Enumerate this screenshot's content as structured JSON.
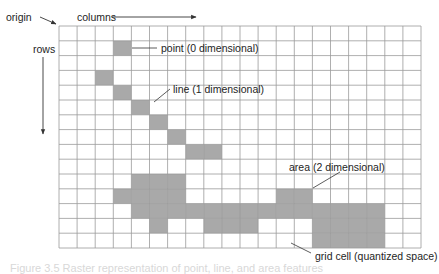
{
  "labels": {
    "origin": "origin",
    "columns": "columns",
    "rows": "rows",
    "point": "point (0 dimensional)",
    "line": "line (1 dimensional)",
    "area": "area (2 dimensional)",
    "grid_cell": "grid cell (quantized space)",
    "caption": "Figure 3.5  Raster representation of point, line, and area features"
  },
  "grid": {
    "columns": 20,
    "rows": 15,
    "left": 59,
    "top": 26,
    "cell_width": 18.1,
    "cell_height": 14.8,
    "line_color": "#9a9a9a",
    "fill_color": "#a9a9a9"
  },
  "features": {
    "point": [
      [
        1,
        3
      ]
    ],
    "line": [
      [
        3,
        2
      ],
      [
        4,
        3
      ],
      [
        5,
        4
      ],
      [
        6,
        5
      ],
      [
        7,
        6
      ],
      [
        8,
        7
      ],
      [
        8,
        8
      ]
    ],
    "area": [
      [
        10,
        4
      ],
      [
        10,
        5
      ],
      [
        10,
        6
      ],
      [
        11,
        3
      ],
      [
        11,
        4
      ],
      [
        11,
        5
      ],
      [
        11,
        6
      ],
      [
        11,
        12
      ],
      [
        11,
        13
      ],
      [
        12,
        4
      ],
      [
        12,
        5
      ],
      [
        12,
        6
      ],
      [
        12,
        7
      ],
      [
        12,
        8
      ],
      [
        12,
        9
      ],
      [
        12,
        10
      ],
      [
        12,
        11
      ],
      [
        12,
        12
      ],
      [
        12,
        13
      ],
      [
        12,
        14
      ],
      [
        12,
        15
      ],
      [
        12,
        16
      ],
      [
        12,
        17
      ],
      [
        13,
        5
      ],
      [
        13,
        8
      ],
      [
        13,
        9
      ],
      [
        13,
        10
      ],
      [
        13,
        14
      ],
      [
        13,
        15
      ],
      [
        13,
        16
      ],
      [
        13,
        17
      ],
      [
        14,
        14
      ],
      [
        14,
        15
      ],
      [
        14,
        16
      ],
      [
        14,
        17
      ]
    ]
  }
}
